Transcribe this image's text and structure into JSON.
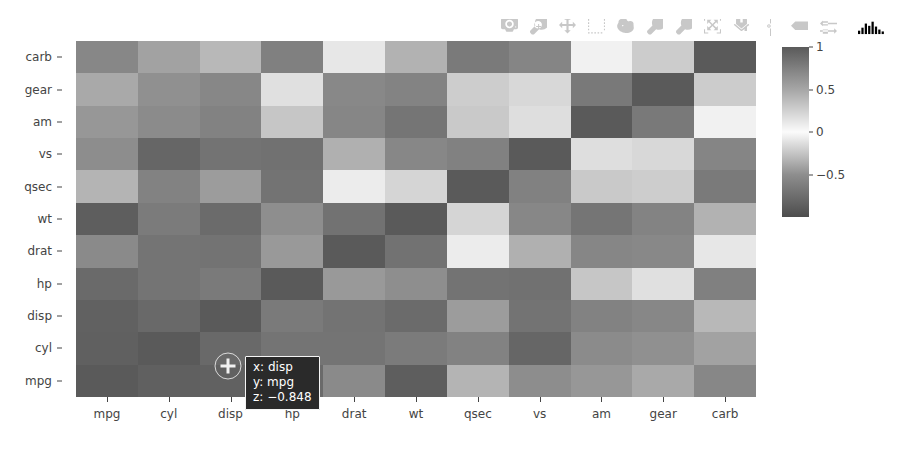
{
  "modebar": {
    "buttons": [
      {
        "name": "download-plot-camera-icon",
        "label": "Download plot as a png"
      },
      {
        "name": "zoom-magnifier-icon",
        "label": "Zoom"
      },
      {
        "name": "pan-crosshair-icon",
        "label": "Pan"
      },
      {
        "name": "box-select-icon",
        "label": "Box Select"
      },
      {
        "name": "lasso-select-icon",
        "label": "Lasso Select"
      },
      {
        "name": "zoom-in-plus-icon",
        "label": "Zoom in"
      },
      {
        "name": "zoom-out-minus-icon",
        "label": "Zoom out"
      },
      {
        "name": "autoscale-icon",
        "label": "Autoscale"
      },
      {
        "name": "reset-axes-home-icon",
        "label": "Reset axes"
      },
      {
        "name": "toggle-spike-lines-icon",
        "label": "Toggle Spike Lines"
      },
      {
        "name": "hover-closest-icon",
        "label": "Show closest data on hover"
      },
      {
        "name": "hover-compare-icon",
        "label": "Compare data on hover"
      }
    ],
    "logo": {
      "name": "plotly-logo-icon",
      "label": "Produced with Plotly"
    },
    "icon_color": "#c8c8c8"
  },
  "hover": {
    "x_line": "x: disp",
    "y_line": "y: mpg",
    "z_line": "z: −0.848",
    "bg_color": "#2a2a2a",
    "text_color": "#ffffff"
  },
  "colorbar": {
    "tick_labels": [
      "1",
      "0.5",
      "0",
      "−0.5"
    ],
    "tick_values": [
      1,
      0.5,
      0,
      -0.5
    ],
    "range": [
      -1,
      1
    ]
  },
  "chart_data": {
    "type": "heatmap",
    "title": "",
    "xlabel": "",
    "ylabel": "",
    "grid": false,
    "legend_position": "right",
    "colorbar_range": [
      -1,
      1
    ],
    "colorbar_ticks": [
      1,
      0.5,
      0,
      -0.5
    ],
    "colorscale": [
      [
        0.0,
        "#4d4d4d"
      ],
      [
        0.25,
        "#8e8e8e"
      ],
      [
        0.5,
        "#fbfbfb"
      ],
      [
        0.75,
        "#a6a6a6"
      ],
      [
        1.0,
        "#5a5a5a"
      ]
    ],
    "x": [
      "mpg",
      "cyl",
      "disp",
      "hp",
      "drat",
      "wt",
      "qsec",
      "vs",
      "am",
      "gear",
      "carb"
    ],
    "y": [
      "mpg",
      "cyl",
      "disp",
      "hp",
      "drat",
      "wt",
      "qsec",
      "vs",
      "am",
      "gear",
      "carb"
    ],
    "y_display_order": [
      "carb",
      "gear",
      "am",
      "vs",
      "qsec",
      "wt",
      "drat",
      "hp",
      "disp",
      "cyl",
      "mpg"
    ],
    "z": [
      [
        1.0,
        -0.852,
        -0.848,
        -0.776,
        0.681,
        -0.868,
        0.419,
        0.664,
        0.6,
        0.48,
        -0.551
      ],
      [
        -0.852,
        1.0,
        0.902,
        0.832,
        -0.7,
        0.782,
        -0.591,
        -0.811,
        -0.523,
        -0.493,
        0.527
      ],
      [
        -0.848,
        0.902,
        1.0,
        0.791,
        -0.71,
        0.888,
        -0.434,
        -0.71,
        -0.591,
        -0.556,
        0.395
      ],
      [
        -0.776,
        0.832,
        0.791,
        1.0,
        -0.449,
        0.659,
        -0.708,
        -0.723,
        -0.243,
        -0.126,
        0.75
      ],
      [
        0.681,
        -0.7,
        -0.71,
        -0.449,
        1.0,
        -0.712,
        0.091,
        0.44,
        0.713,
        0.7,
        -0.091
      ],
      [
        -0.868,
        0.782,
        0.888,
        0.659,
        -0.712,
        1.0,
        -0.175,
        -0.555,
        -0.692,
        -0.583,
        0.428
      ],
      [
        0.419,
        -0.591,
        -0.434,
        -0.708,
        0.091,
        -0.175,
        1.0,
        0.745,
        -0.23,
        -0.213,
        -0.656
      ],
      [
        0.664,
        -0.811,
        -0.71,
        -0.723,
        0.44,
        -0.555,
        0.745,
        1.0,
        0.168,
        0.206,
        -0.57
      ],
      [
        0.6,
        -0.523,
        -0.591,
        -0.243,
        0.713,
        -0.692,
        -0.23,
        0.168,
        1.0,
        0.794,
        0.058
      ],
      [
        0.48,
        -0.493,
        -0.556,
        -0.126,
        0.7,
        -0.583,
        -0.213,
        0.206,
        0.794,
        1.0,
        0.274
      ],
      [
        -0.551,
        0.527,
        0.395,
        0.75,
        -0.091,
        0.428,
        -0.656,
        -0.57,
        0.058,
        0.274,
        1.0
      ]
    ]
  }
}
